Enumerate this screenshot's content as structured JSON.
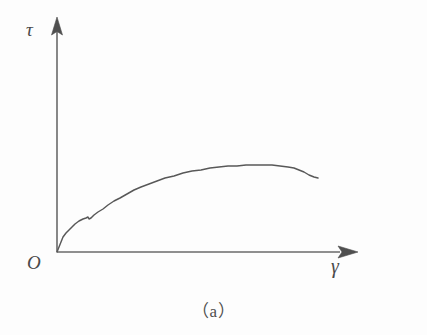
{
  "figure": {
    "caption": "（a）",
    "background_color": "#fdfdfd",
    "ink_color": "#585858"
  },
  "axes": {
    "y_axis": {
      "label": "τ",
      "name": "shear-stress",
      "arrow": "up-arrowhead",
      "origin_px": [
        57,
        252
      ],
      "tip_px": [
        57,
        18
      ]
    },
    "x_axis": {
      "label": "γ",
      "name": "shear-strain",
      "arrow": "right-arrowhead",
      "origin_px": [
        57,
        252
      ],
      "tip_px": [
        357,
        252
      ]
    },
    "origin": {
      "label": "O"
    }
  },
  "chart_data": {
    "type": "line",
    "title": "（a）",
    "xlabel": "γ",
    "ylabel": "τ",
    "grid": false,
    "legend": null,
    "axis_arrows": true,
    "xlim": [
      0,
      1
    ],
    "ylim": [
      0,
      1
    ],
    "series": [
      {
        "name": "shear-stress-strain-curve",
        "color": "#585858",
        "annotations": [
          "yield-kink near start",
          "plateau then slight drop at end"
        ],
        "points_px": [
          [
            57,
            252
          ],
          [
            59,
            247
          ],
          [
            61,
            242
          ],
          [
            63,
            237
          ],
          [
            66,
            233
          ],
          [
            69,
            230
          ],
          [
            72,
            227
          ],
          [
            75,
            224
          ],
          [
            79,
            221
          ],
          [
            83,
            219
          ],
          [
            86,
            218
          ],
          [
            88,
            217
          ],
          [
            89,
            219
          ],
          [
            91,
            218
          ],
          [
            94,
            215
          ],
          [
            98,
            212
          ],
          [
            103,
            209
          ],
          [
            108,
            205
          ],
          [
            114,
            201
          ],
          [
            120,
            198
          ],
          [
            127,
            194
          ],
          [
            134,
            190
          ],
          [
            141,
            187
          ],
          [
            149,
            184
          ],
          [
            157,
            181
          ],
          [
            165,
            178
          ],
          [
            174,
            176
          ],
          [
            183,
            173
          ],
          [
            192,
            171
          ],
          [
            201,
            170
          ],
          [
            210,
            168
          ],
          [
            219,
            167
          ],
          [
            228,
            166
          ],
          [
            237,
            166
          ],
          [
            246,
            165
          ],
          [
            255,
            165
          ],
          [
            264,
            165
          ],
          [
            272,
            165
          ],
          [
            280,
            166
          ],
          [
            288,
            167
          ],
          [
            294,
            168
          ],
          [
            299,
            170
          ],
          [
            304,
            172
          ],
          [
            309,
            175
          ],
          [
            314,
            177
          ],
          [
            318,
            178
          ]
        ],
        "x": [
          0.0,
          0.007,
          0.013,
          0.02,
          0.03,
          0.04,
          0.05,
          0.06,
          0.073,
          0.087,
          0.097,
          0.103,
          0.107,
          0.113,
          0.123,
          0.137,
          0.153,
          0.17,
          0.19,
          0.21,
          0.233,
          0.257,
          0.28,
          0.307,
          0.333,
          0.36,
          0.39,
          0.42,
          0.45,
          0.48,
          0.51,
          0.54,
          0.57,
          0.6,
          0.63,
          0.66,
          0.69,
          0.717,
          0.743,
          0.77,
          0.79,
          0.807,
          0.823,
          0.84,
          0.857,
          0.87
        ],
        "y": [
          0.0,
          0.021,
          0.043,
          0.064,
          0.081,
          0.094,
          0.107,
          0.12,
          0.132,
          0.141,
          0.145,
          0.15,
          0.141,
          0.145,
          0.158,
          0.171,
          0.184,
          0.201,
          0.218,
          0.231,
          0.248,
          0.265,
          0.278,
          0.291,
          0.303,
          0.316,
          0.325,
          0.338,
          0.346,
          0.35,
          0.359,
          0.363,
          0.368,
          0.368,
          0.372,
          0.372,
          0.372,
          0.372,
          0.368,
          0.363,
          0.359,
          0.35,
          0.342,
          0.329,
          0.321,
          0.316
        ]
      }
    ]
  }
}
